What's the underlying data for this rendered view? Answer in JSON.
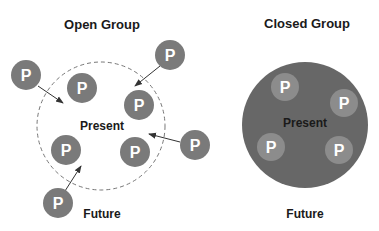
{
  "open_group": {
    "title": "Open Group",
    "center_label": "Present",
    "bottom_label": "Future",
    "boundary": "dashed",
    "members_inside": [
      {
        "label": "P",
        "x": 82,
        "y": 88
      },
      {
        "label": "P",
        "x": 139,
        "y": 105
      },
      {
        "label": "P",
        "x": 66,
        "y": 150
      },
      {
        "label": "P",
        "x": 135,
        "y": 152
      }
    ],
    "members_outside": [
      {
        "label": "P",
        "x": 26,
        "y": 75
      },
      {
        "label": "P",
        "x": 170,
        "y": 55
      },
      {
        "label": "P",
        "x": 195,
        "y": 145
      },
      {
        "label": "P",
        "x": 58,
        "y": 203
      }
    ]
  },
  "closed_group": {
    "title": "Closed Group",
    "center_label": "Present",
    "bottom_label": "Future",
    "boundary": "solid",
    "members": [
      {
        "label": "P",
        "x": 285,
        "y": 87
      },
      {
        "label": "P",
        "x": 344,
        "y": 103
      },
      {
        "label": "P",
        "x": 271,
        "y": 147
      },
      {
        "label": "P",
        "x": 339,
        "y": 150
      }
    ]
  },
  "colors": {
    "member_fill": "#7a7a7a",
    "closed_fill": "#676767",
    "closed_member_fill": "#8c8c8c",
    "dashed_line": "#777777",
    "arrow": "#333333"
  }
}
